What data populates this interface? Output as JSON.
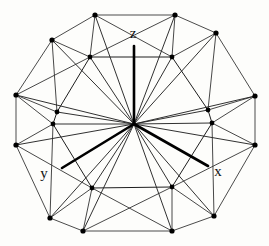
{
  "figure": {
    "background_color": "#fdfdfb",
    "edge_color": "#2a2a2a",
    "vertex_color": "#000000",
    "axis_color": "#000000",
    "center": {
      "x": 134,
      "y": 124
    }
  },
  "axes": [
    {
      "name": "z",
      "label": "z",
      "label_x": 133,
      "label_y": 38,
      "x1": 134,
      "y1": 124,
      "x2": 134,
      "y2": 46
    },
    {
      "name": "y",
      "label": "y",
      "label_x": 44,
      "label_y": 178,
      "x1": 134,
      "y1": 124,
      "x2": 62,
      "y2": 168
    },
    {
      "name": "x",
      "label": "x",
      "label_x": 218,
      "label_y": 176,
      "x1": 134,
      "y1": 124,
      "x2": 208,
      "y2": 166
    }
  ],
  "outer_ring": {
    "name": "outer-vertex-ring",
    "count": 12,
    "points": [
      {
        "x": 95,
        "y": 15
      },
      {
        "x": 175,
        "y": 15
      },
      {
        "x": 216,
        "y": 33
      },
      {
        "x": 255,
        "y": 96
      },
      {
        "x": 255,
        "y": 145
      },
      {
        "x": 214,
        "y": 216
      },
      {
        "x": 172,
        "y": 231
      },
      {
        "x": 83,
        "y": 231
      },
      {
        "x": 50,
        "y": 218
      },
      {
        "x": 16,
        "y": 145
      },
      {
        "x": 16,
        "y": 95
      },
      {
        "x": 52,
        "y": 40
      }
    ]
  },
  "inner_ring": {
    "name": "inner-vertex-ring",
    "count": 10,
    "points": [
      {
        "x": 90,
        "y": 57
      },
      {
        "x": 172,
        "y": 57
      },
      {
        "x": 212,
        "y": 123
      },
      {
        "x": 208,
        "y": 110
      },
      {
        "x": 172,
        "y": 187
      },
      {
        "x": 92,
        "y": 188
      },
      {
        "x": 53,
        "y": 124
      },
      {
        "x": 57,
        "y": 112
      }
    ]
  },
  "legend": {
    "vertex_count_label": "",
    "caption": ""
  }
}
